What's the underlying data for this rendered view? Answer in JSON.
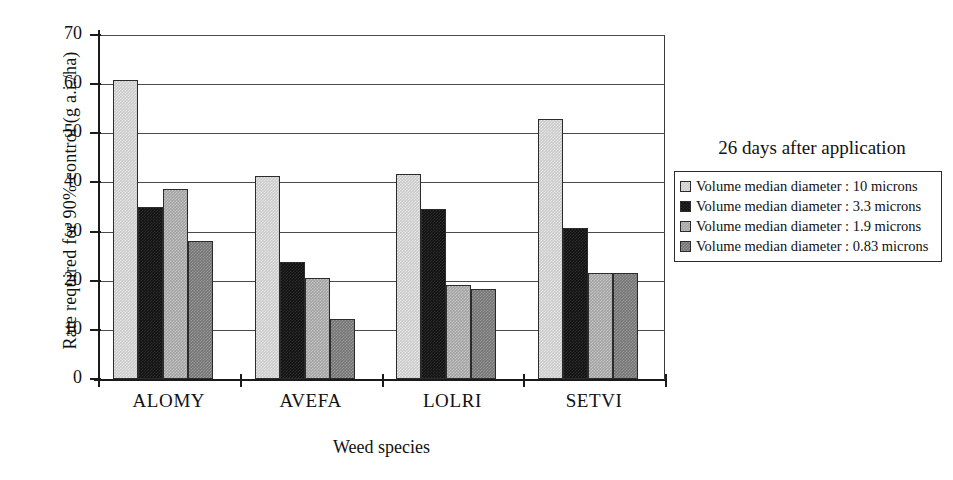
{
  "chart_data": {
    "type": "bar",
    "title": "",
    "xlabel": "Weed species",
    "ylabel": "Rate required for 90% control (g a.i./ha)",
    "categories": [
      "ALOMY",
      "AVEFA",
      "LOLRI",
      "SETVI"
    ],
    "ylim": [
      0,
      70
    ],
    "yticks": [
      0,
      10,
      20,
      30,
      40,
      50,
      60,
      70
    ],
    "ytick_labels": [
      "0",
      "10",
      "20",
      "30",
      "40",
      "50",
      "60",
      "70"
    ],
    "grid": "horizontal",
    "legend_position": "right",
    "legend_title": "26 days after application",
    "series": [
      {
        "name": "Volume median diameter : 10 microns",
        "color": "#c9c9c9",
        "values": [
          60.8,
          41.3,
          41.8,
          53.0
        ]
      },
      {
        "name": "Volume median diameter : 3.3 microns",
        "color": "#111111",
        "values": [
          35.0,
          23.8,
          34.6,
          30.8
        ]
      },
      {
        "name": "Volume median diameter : 1.9 microns",
        "color": "#a2a2a2",
        "values": [
          38.6,
          20.6,
          19.1,
          21.5
        ]
      },
      {
        "name": "Volume median diameter : 0.83 microns",
        "color": "#757575",
        "values": [
          28.0,
          12.2,
          18.4,
          21.5
        ]
      }
    ]
  },
  "axes": {
    "y_title": "Rate required for 90% control (g a.i./ha)",
    "x_title": "Weed species",
    "y_labels": [
      "70",
      "60",
      "50",
      "40",
      "30",
      "20",
      "10",
      "0"
    ],
    "x_labels": [
      "ALOMY",
      "AVEFA",
      "LOLRI",
      "SETVI"
    ]
  },
  "legend": {
    "title": "26 days after application",
    "items": [
      {
        "label": "Volume median diameter : 10 microns",
        "color": "#c9c9c9"
      },
      {
        "label": "Volume median diameter : 3.3 microns",
        "color": "#111111"
      },
      {
        "label": "Volume median diameter : 1.9 microns",
        "color": "#a2a2a2"
      },
      {
        "label": "Volume median diameter : 0.83 microns",
        "color": "#757575"
      }
    ]
  }
}
